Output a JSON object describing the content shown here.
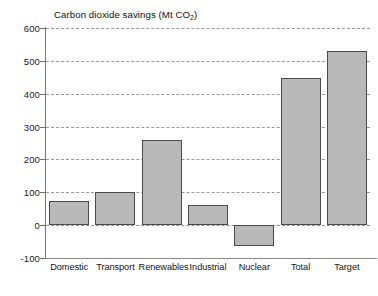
{
  "chart_data": {
    "type": "bar",
    "title": "Carbon dioxide savings (Mt CO2)",
    "title_main": "Carbon dioxide savings (Mt CO",
    "title_sub": "2",
    "title_tail": ")",
    "xlabel": "",
    "ylabel": "",
    "ylim": [
      -100,
      600
    ],
    "ytick_step": 100,
    "grid": true,
    "legend": "none",
    "categories": [
      "Domestic",
      "Transport",
      "Renewables",
      "Industrial",
      "Nuclear",
      "Total",
      "Target"
    ],
    "values": [
      75,
      100,
      260,
      60,
      -65,
      448,
      530
    ],
    "yticks": [
      "600",
      "500",
      "400",
      "300",
      "200",
      "100",
      "0",
      "-100"
    ],
    "ytick_values": [
      600,
      500,
      400,
      300,
      200,
      100,
      0,
      -100
    ],
    "colors": {
      "bar_fill": "#b9b9b9",
      "bar_border": "#4a4a4a",
      "gridline": "#9a9a9a",
      "axis": "#777777",
      "text": "#111111",
      "background": "#ffffff"
    }
  }
}
